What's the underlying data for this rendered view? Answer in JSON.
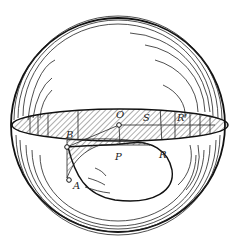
{
  "figure": {
    "labels": {
      "O": "O",
      "S": "S",
      "R_prime": "R'",
      "B": "B",
      "P": "P",
      "R": "R",
      "A": "A"
    },
    "colors": {
      "stroke": "#1a1a1a",
      "background": "#ffffff"
    }
  }
}
